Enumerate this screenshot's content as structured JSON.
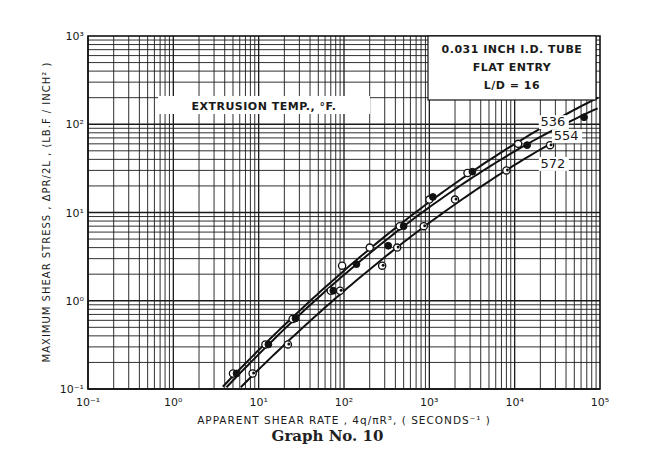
{
  "chart_data": {
    "type": "scatter",
    "title": "",
    "caption": "Graph No. 10",
    "xlabel": "APPARENT SHEAR RATE , 4q/πR³, ( SECONDS⁻¹ )",
    "ylabel": "MAXIMUM SHEAR STRESS , ΔPR/2L , (LB.F / INCH² )",
    "xscale": "log",
    "yscale": "log",
    "xlim": [
      0.1,
      100000
    ],
    "ylim": [
      0.1,
      1000
    ],
    "x_tick_labels": [
      "10⁻¹",
      "10⁰",
      "10¹",
      "10²",
      "10³",
      "10⁴",
      "10⁵"
    ],
    "y_tick_labels": [
      "10⁻¹",
      "10⁰",
      "10¹",
      "10²",
      "10³"
    ],
    "grid": true,
    "info_box": [
      "0.031 INCH I.D. TUBE",
      "FLAT ENTRY",
      "L/D  =  16"
    ],
    "legend_title": "EXTRUSION TEMP., °F.",
    "series": [
      {
        "name": "536",
        "marker": "open-circle",
        "x": [
          5.0,
          12,
          25,
          70,
          95,
          200,
          450,
          1000,
          2800,
          11000
        ],
        "y": [
          0.15,
          0.32,
          0.62,
          1.3,
          2.5,
          4.0,
          7.0,
          14,
          28,
          60
        ]
      },
      {
        "name": "554",
        "marker": "filled-circle",
        "x": [
          5.5,
          13,
          27,
          75,
          140,
          330,
          500,
          1100,
          3200,
          14000,
          65000
        ],
        "y": [
          0.15,
          0.32,
          0.63,
          1.3,
          2.6,
          4.2,
          7.0,
          15,
          29,
          58,
          120
        ]
      },
      {
        "name": "572",
        "marker": "open-circle-dot",
        "x": [
          8.5,
          22,
          90,
          280,
          420,
          860,
          2000,
          8000,
          26000
        ],
        "y": [
          0.15,
          0.32,
          1.3,
          2.5,
          4.0,
          7.0,
          14,
          30,
          58
        ]
      }
    ],
    "curve_labels": [
      {
        "text": "536",
        "x": 28000,
        "y": 95
      },
      {
        "text": "554",
        "x": 40000,
        "y": 66
      },
      {
        "text": "572",
        "x": 28000,
        "y": 32
      }
    ]
  }
}
